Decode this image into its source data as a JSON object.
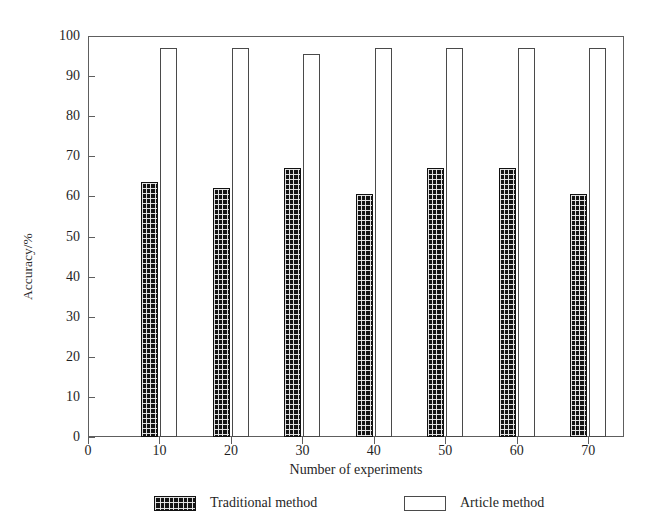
{
  "chart_data": {
    "type": "bar",
    "title": "",
    "xlabel": "Number of experiments",
    "ylabel": "Accuracy/%",
    "categories": [
      10,
      20,
      30,
      40,
      50,
      60,
      70
    ],
    "xtick_labels": [
      "0",
      "10",
      "20",
      "30",
      "40",
      "50",
      "60",
      "70"
    ],
    "xtick_values": [
      0,
      10,
      20,
      30,
      40,
      50,
      60,
      70
    ],
    "ytick_labels": [
      "0",
      "10",
      "20",
      "30",
      "40",
      "50",
      "60",
      "70",
      "80",
      "90",
      "100"
    ],
    "ytick_values": [
      0,
      10,
      20,
      30,
      40,
      50,
      60,
      70,
      80,
      90,
      100
    ],
    "xlim": [
      0,
      75
    ],
    "ylim": [
      0,
      100
    ],
    "grid": false,
    "legend_position": "bottom",
    "series": [
      {
        "name": "Traditional method",
        "fill": "checkered-dark",
        "color": "#141414",
        "values": [
          63.5,
          62.0,
          67.0,
          60.5,
          67.0,
          67.0,
          60.5
        ]
      },
      {
        "name": "Article method",
        "fill": "hollow-white",
        "color": "#ffffff",
        "values": [
          97.0,
          97.0,
          95.5,
          97.0,
          97.0,
          97.0,
          97.0
        ]
      }
    ]
  },
  "legend": {
    "entries": [
      {
        "label": "Traditional method"
      },
      {
        "label": "Article method"
      }
    ]
  },
  "axis": {
    "y_title": "Accuracy/%",
    "x_title": "Number of experiments"
  }
}
